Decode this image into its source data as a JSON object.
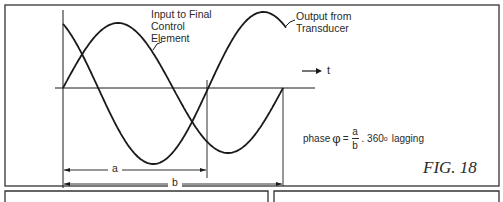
{
  "figure": {
    "label": "FIG. 18",
    "curves": [
      {
        "name": "input",
        "label_lines": [
          "Input to Final",
          "Control",
          "Element"
        ]
      },
      {
        "name": "output",
        "label_lines": [
          "Output from",
          "Transducer"
        ]
      }
    ],
    "time_axis_label": "t",
    "dimensions": {
      "a": "a",
      "b": "b"
    },
    "formula": {
      "prefix": "phase",
      "symbol": "φ",
      "equals": "=",
      "numerator": "a",
      "denominator": "b",
      "multiplier": ". 360",
      "degree": "o",
      "suffix": "lagging"
    }
  },
  "colors": {
    "line": "#1a1a1a",
    "frame": "#333333",
    "background": "#ffffff"
  }
}
